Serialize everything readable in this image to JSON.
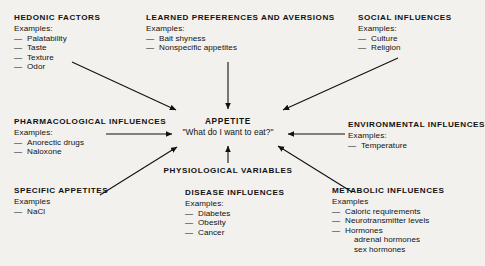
{
  "center": {
    "title": "APPETITE",
    "question": "\"What do I want to eat?\""
  },
  "physiological_variables": {
    "title": "PHYSIOLOGICAL VARIABLES"
  },
  "blocks": {
    "hedonic": {
      "title": "HEDONIC FACTORS",
      "examples_label": "Examples:",
      "items": [
        "Palatability",
        "Taste",
        "Texture",
        "Odor"
      ]
    },
    "learned": {
      "title": "LEARNED PREFERENCES AND AVERSIONS",
      "examples_label": "Examples:",
      "items": [
        "Bait shyness",
        "Nonspecific appetites"
      ]
    },
    "social": {
      "title": "SOCIAL INFLUENCES",
      "examples_label": "Examples:",
      "items": [
        "Culture",
        "Religion"
      ]
    },
    "pharmacological": {
      "title": "PHARMACOLOGICAL INFLUENCES",
      "examples_label": "Examples:",
      "items": [
        "Anorectic drugs",
        "Naloxone"
      ]
    },
    "environmental": {
      "title": "ENVIRONMENTAL INFLUENCES",
      "examples_label": "Examples:",
      "items": [
        "Temperature"
      ]
    },
    "specific_appetites": {
      "title": "SPECIFIC APPETITES",
      "examples_label": "Examples",
      "items": [
        "NaCl"
      ]
    },
    "disease": {
      "title": "DISEASE INFLUENCES",
      "examples_label": "Examples:",
      "items": [
        "Diabetes",
        "Obesity",
        "Cancer"
      ]
    },
    "metabolic": {
      "title": "METABOLIC INFLUENCES",
      "examples_label": "Examples",
      "items": [
        "Caloric requirements",
        "Neurotransmitter levels",
        "Hormones"
      ],
      "subitems": [
        "adrenal hormones",
        "sex hormones"
      ]
    }
  },
  "dash": "—",
  "colors": {
    "background": "#f2f1ee",
    "ink": "#111111"
  }
}
